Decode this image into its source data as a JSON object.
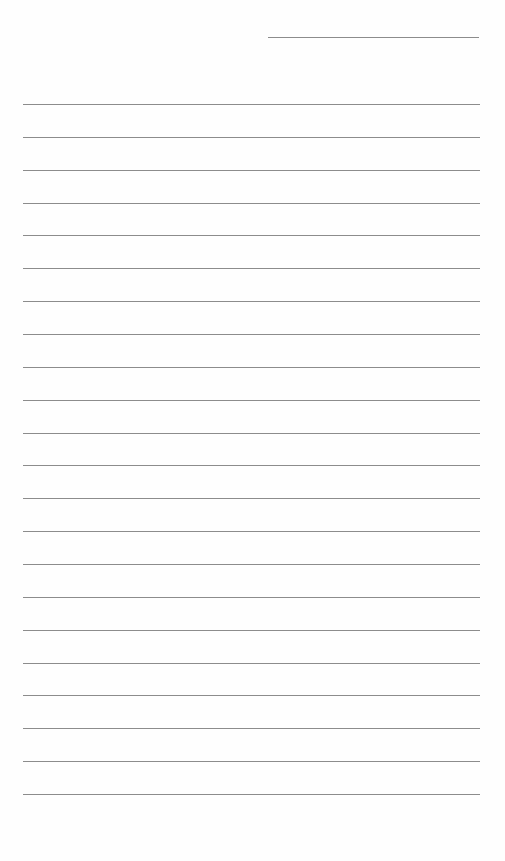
{
  "page": {
    "type": "lined-paper",
    "background_color": "#fefefe",
    "line_color": "#8c8c8c",
    "header_line": {
      "left": 268,
      "top": 37,
      "width": 211
    },
    "rules": {
      "left": 23,
      "width": 457,
      "first_top": 104,
      "spacing": 32.86,
      "count": 22
    }
  }
}
